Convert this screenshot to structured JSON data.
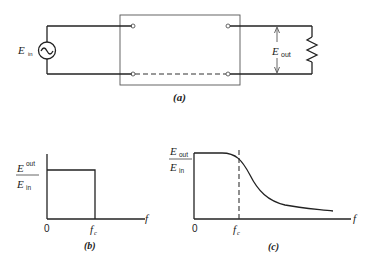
{
  "figure_a": {
    "caption": "(a)",
    "source_label": "E",
    "source_sub": "in",
    "output_label": "E",
    "output_sub": "out"
  },
  "figure_b": {
    "caption": "(b)",
    "ylabel_num": "E",
    "ylabel_num_sub": "out",
    "ylabel_den": "E",
    "ylabel_den_sub": "in",
    "xlabel": "f",
    "origin": "0",
    "cutoff": "f",
    "cutoff_sub": "c"
  },
  "figure_c": {
    "caption": "(c)",
    "ylabel_num": "E",
    "ylabel_num_sub": "out",
    "ylabel_den": "E",
    "ylabel_den_sub": "in",
    "xlabel": "f",
    "origin": "0",
    "cutoff": "f",
    "cutoff_sub": "c"
  }
}
